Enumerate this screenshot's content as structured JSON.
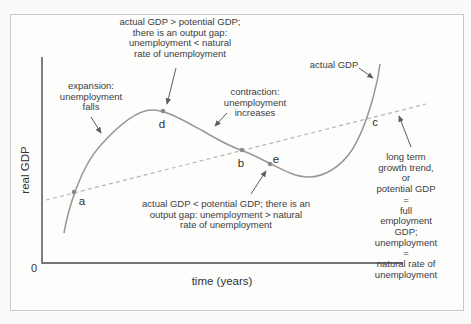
{
  "figure": {
    "axis": {
      "y_label": "real GDP",
      "x_label": "time (years)",
      "origin": "0"
    },
    "curve_label": "actual GDP",
    "point_labels": [
      "a",
      "b",
      "c",
      "d",
      "e"
    ],
    "annotations": {
      "output_gap_positive": "actual GDP > potential GDP;\nthere is an output gap:\nunemployment < natural\nrate of unemployment",
      "expansion": "expansion:\nunemployment\nfalls",
      "contraction": "contraction:\nunemployment\nincreases",
      "output_gap_negative": "actual GDP < potential GDP; there is an\noutput gap: unemployment > natural\nrate of unemployment",
      "long_term_trend": "long term\ngrowth trend, or\npotential GDP =\nfull employment GDP;\nunemployment =\nnatural rate of\nunemployment"
    },
    "colors": {
      "curve": "#979797",
      "trend_line": "#b5b5b3",
      "axes": "#4a4a4a",
      "arrows": "#5c5c5c",
      "text": "#3c3c3c",
      "frame_border": "#c9c9c7",
      "point_marker": "#8a8a8a"
    }
  }
}
